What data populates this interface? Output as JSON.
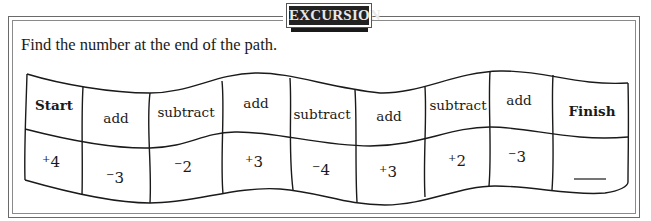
{
  "banner": {
    "title": "EXCURSION"
  },
  "instruction": "Find the number at the end of the path.",
  "path": {
    "operations": [
      {
        "label": "Start",
        "bold": true
      },
      {
        "label": "add"
      },
      {
        "label": "subtract"
      },
      {
        "label": "add"
      },
      {
        "label": "subtract"
      },
      {
        "label": "add"
      },
      {
        "label": "subtract"
      },
      {
        "label": "add"
      },
      {
        "label": "Finish",
        "bold": true
      }
    ],
    "values": [
      {
        "sign": "+",
        "digit": "4"
      },
      {
        "sign": "−",
        "digit": "3"
      },
      {
        "sign": "−",
        "digit": "2"
      },
      {
        "sign": "+",
        "digit": "3"
      },
      {
        "sign": "−",
        "digit": "4"
      },
      {
        "sign": "+",
        "digit": "3"
      },
      {
        "sign": "+",
        "digit": "2"
      },
      {
        "sign": "−",
        "digit": "3"
      },
      {
        "sign": "",
        "digit": "",
        "answer_blank": true
      }
    ]
  }
}
